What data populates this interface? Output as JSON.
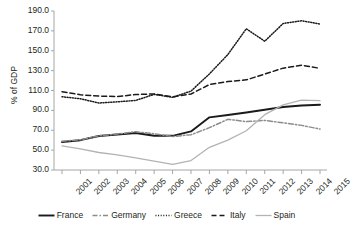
{
  "chart_data": {
    "type": "line",
    "title": "",
    "xlabel": "",
    "ylabel": "% of GDP",
    "ylim": [
      30.0,
      190.0
    ],
    "yticks": [
      "30.0",
      "50.0",
      "70.0",
      "90.0",
      "110.0",
      "130.0",
      "150.0",
      "170.0",
      "190.0"
    ],
    "ytick_values": [
      30,
      50,
      70,
      90,
      110,
      130,
      150,
      170,
      190
    ],
    "grid": false,
    "legend_position": "bottom",
    "categories": [
      "2001",
      "2002",
      "2003",
      "2004",
      "2005",
      "2006",
      "2007",
      "2008",
      "2009",
      "2010",
      "2011",
      "2012",
      "2013",
      "2014",
      "2015"
    ],
    "x": [
      2001,
      2002,
      2003,
      2004,
      2005,
      2006,
      2007,
      2008,
      2009,
      2010,
      2011,
      2012,
      2013,
      2014,
      2015
    ],
    "series": [
      {
        "name": "France",
        "style": "solid",
        "color": "#1a1a1a",
        "values": [
          58.2,
          60.0,
          64.2,
          65.7,
          67.2,
          64.4,
          64.4,
          68.8,
          83.0,
          85.3,
          87.8,
          90.6,
          93.4,
          94.9,
          95.6
        ]
      },
      {
        "name": "Germany",
        "style": "dash-dot",
        "color": "#8c8c8c",
        "values": [
          58.9,
          60.4,
          64.4,
          66.2,
          68.5,
          66.5,
          63.7,
          65.5,
          72.6,
          81.0,
          78.7,
          79.9,
          77.5,
          74.9,
          71.2
        ]
      },
      {
        "name": "Greece",
        "style": "dotted",
        "color": "#1a1a1a",
        "values": [
          103.7,
          101.7,
          97.4,
          98.6,
          100.0,
          106.1,
          103.1,
          109.4,
          126.7,
          146.2,
          172.1,
          159.6,
          177.4,
          180.2,
          176.9
        ]
      },
      {
        "name": "Italy",
        "style": "dashed",
        "color": "#1a1a1a",
        "values": [
          108.8,
          105.7,
          104.4,
          103.9,
          105.9,
          106.6,
          103.6,
          106.5,
          116.0,
          119.0,
          120.7,
          126.5,
          132.5,
          135.4,
          132.3
        ]
      },
      {
        "name": "Spain",
        "style": "solid-light",
        "color": "#b3b3b3",
        "values": [
          54.2,
          51.3,
          47.6,
          45.3,
          42.3,
          38.9,
          35.6,
          39.5,
          52.8,
          60.1,
          69.5,
          85.7,
          95.5,
          100.4,
          99.8
        ]
      }
    ]
  },
  "legend": {
    "items": [
      {
        "label": "France"
      },
      {
        "label": "Germany"
      },
      {
        "label": "Greece"
      },
      {
        "label": "Italy"
      },
      {
        "label": "Spain"
      }
    ]
  }
}
